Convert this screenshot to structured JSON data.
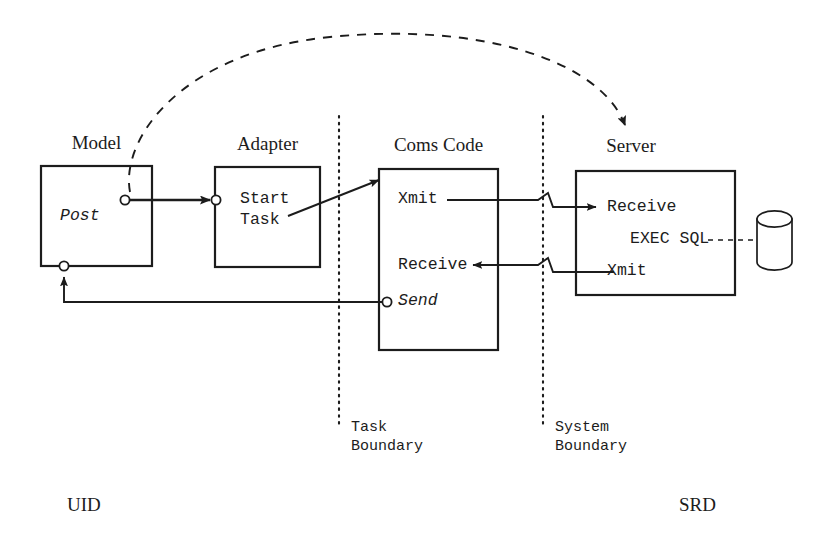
{
  "diagram": {
    "title_note": "",
    "boxes": [
      {
        "id": "model",
        "title": "Model",
        "ports": [
          "Post"
        ]
      },
      {
        "id": "adapter",
        "title": "Adapter",
        "ports": [
          "Start",
          "Task"
        ]
      },
      {
        "id": "coms_code",
        "title": "Coms Code",
        "ports": [
          "Xmit",
          "Receive",
          "Send"
        ]
      },
      {
        "id": "server",
        "title": "Server",
        "ports": [
          "Receive",
          "EXEC SQL",
          "Xmit"
        ]
      }
    ],
    "model": {
      "title": "Model",
      "post_label": "Post"
    },
    "adapter": {
      "title": "Adapter",
      "line1": "Start",
      "line2": "Task"
    },
    "coms_code": {
      "title": "Coms Code",
      "xmit_label": "Xmit",
      "receive_label": "Receive",
      "send_label": "Send"
    },
    "server": {
      "title": "Server",
      "receive_label": "Receive",
      "exec_sql_label": "EXEC SQL",
      "xmit_label": "Xmit"
    },
    "datastore": {
      "name": "database-cylinder"
    },
    "boundaries": [
      {
        "id": "task",
        "line1": "Task",
        "line2": "Boundary"
      },
      {
        "id": "system",
        "line1": "System",
        "line2": "Boundary"
      }
    ],
    "task_boundary": {
      "line1": "Task",
      "line2": "Boundary"
    },
    "system_boundary": {
      "line1": "System",
      "line2": "Boundary"
    },
    "corner_labels": {
      "left": "UID",
      "right": "SRD"
    },
    "colors": {
      "stroke": "#1c1c1c",
      "background": "#ffffff"
    }
  }
}
